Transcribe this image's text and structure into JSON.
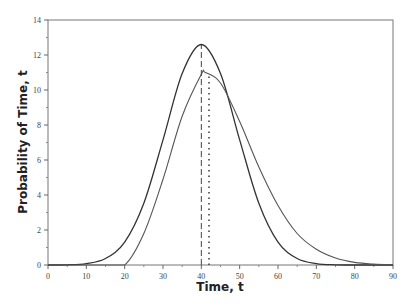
{
  "chart_data": {
    "type": "line",
    "title": "",
    "xlabel": "Time, t",
    "ylabel": "Probability of Time, t",
    "xlim": [
      0,
      90
    ],
    "ylim": [
      0,
      14
    ],
    "xticks": [
      0,
      10,
      20,
      30,
      40,
      50,
      60,
      70,
      80,
      90
    ],
    "yticks": [
      0,
      2,
      4,
      6,
      8,
      10,
      12,
      14
    ],
    "grid": false,
    "legend": "none",
    "series": [
      {
        "name": "symmetric distribution",
        "color": "#333333",
        "x": [
          0,
          5,
          10,
          15,
          20,
          25,
          30,
          35,
          40,
          45,
          50,
          55,
          60,
          65,
          70,
          75,
          80,
          85,
          90
        ],
        "y": [
          0.0,
          0.01,
          0.08,
          0.37,
          1.31,
          3.53,
          7.15,
          10.94,
          12.6,
          10.94,
          7.15,
          3.53,
          1.31,
          0.37,
          0.08,
          0.01,
          0.0,
          0.0,
          0.0
        ]
      },
      {
        "name": "skewed distribution",
        "color": "#555555",
        "x": [
          0,
          5,
          10,
          15,
          20,
          25,
          30,
          35,
          40,
          41,
          45,
          50,
          55,
          60,
          65,
          70,
          75,
          80,
          85,
          90
        ],
        "y": [
          0,
          0,
          0,
          0,
          0,
          1.8,
          4.9,
          8.5,
          10.9,
          11.0,
          10.4,
          8.2,
          5.6,
          3.4,
          1.8,
          0.9,
          0.4,
          0.15,
          0.05,
          0.01
        ]
      }
    ],
    "annotations": [
      {
        "type": "vline",
        "style": "dashed",
        "x": 40,
        "y_to": 12.6
      },
      {
        "type": "vline",
        "style": "dotted",
        "x": 42,
        "y_to": 11.0
      }
    ]
  }
}
